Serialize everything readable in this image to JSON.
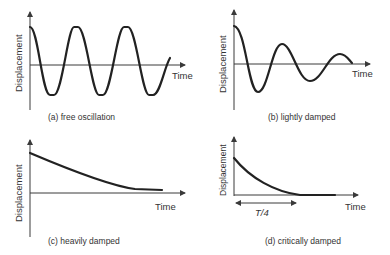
{
  "figure": {
    "panels": [
      {
        "id": "a",
        "caption": "(a) free oscillation",
        "ylabel": "Displacement",
        "xlabel": "Time",
        "behavior": "constant-amplitude sine"
      },
      {
        "id": "b",
        "caption": "(b) lightly damped",
        "ylabel": "Displacement",
        "xlabel": "Time",
        "behavior": "decaying oscillation"
      },
      {
        "id": "c",
        "caption": "(c) heavily damped",
        "ylabel": "Displacement",
        "xlabel": "Time",
        "behavior": "slow monotonic decay"
      },
      {
        "id": "d",
        "caption": "(d) critically damped",
        "ylabel": "Displacement",
        "xlabel": "Time",
        "annotation": "T/4",
        "behavior": "fast monotonic decay to zero"
      }
    ],
    "colors": {
      "curve": "#222222",
      "axis": "#3a3a3a",
      "text": "#333333",
      "background": "#ffffff"
    }
  }
}
